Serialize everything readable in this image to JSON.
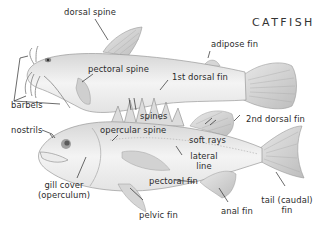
{
  "title": "CATFISH",
  "labels": {
    "dorsal_spine": "dorsal spine",
    "adipose_fin": "adipose fin",
    "pectoral_spine": "pectoral spine",
    "first_dorsal_fin": "1st dorsal fin",
    "barbels": "barbels",
    "spines": "spines",
    "nostrils": "nostrils",
    "opercular_spine": "opercular spine",
    "second_dorsal_fin": "2nd dorsal fin",
    "soft_rays": "soft rays",
    "lateral_line_1": "lateral",
    "lateral_line_2": "line",
    "gill_cover_1": "gill cover",
    "gill_cover_2": "(operculum)",
    "pectoral_fin": "pectoral fin",
    "tail_1": "tail (caudal)",
    "tail_2": "fin",
    "pelvic_fin": "pelvic fin",
    "anal_fin": "anal fin"
  },
  "colors": {
    "ink": "#2b2b2b",
    "body_fill": "#efefef",
    "fin_fill": "#d9d9d9",
    "shade": "#bdbdbd"
  }
}
